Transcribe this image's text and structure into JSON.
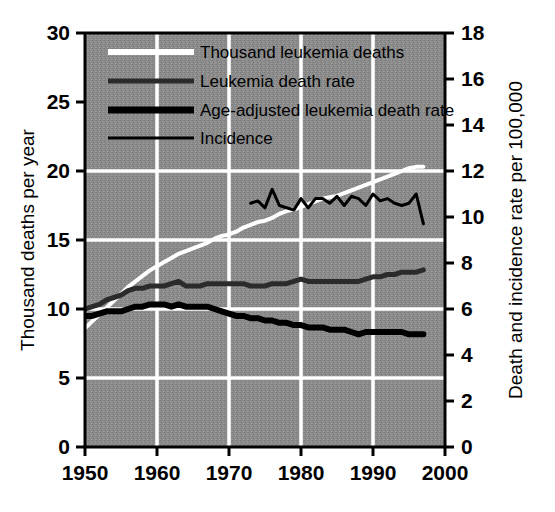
{
  "chart_data": {
    "type": "line",
    "title": "",
    "subtitle": "",
    "xlabel": "",
    "ylabel": "Thousand deaths per year",
    "y2label": "Death and incidence rate per 100,000",
    "xlim": [
      1950,
      2000
    ],
    "ylim": [
      0,
      30
    ],
    "y2lim": [
      0,
      18
    ],
    "xticks": [
      "1950",
      "1960",
      "1970",
      "1980",
      "1990",
      "2000"
    ],
    "xtick_values": [
      1950,
      1960,
      1970,
      1980,
      1990,
      2000
    ],
    "yticks": [
      "0",
      "5",
      "10",
      "15",
      "20",
      "25",
      "30"
    ],
    "ytick_values": [
      0,
      5,
      10,
      15,
      20,
      25,
      30
    ],
    "y2ticks": [
      "0",
      "2",
      "4",
      "6",
      "8",
      "10",
      "12",
      "14",
      "16",
      "18"
    ],
    "y2tick_values": [
      0,
      2,
      4,
      6,
      8,
      10,
      12,
      14,
      16,
      18
    ],
    "grid": "white gridlines on gray plot background, major x at decades, major y at 5/10/15/20 (left scale)",
    "grid_on": true,
    "legend_position": "top-left inside plot",
    "plot_background": "#8a8a8a",
    "gridline_color": "#ffffff",
    "series": [
      {
        "name": "Thousand leukemia deaths",
        "axis": "left",
        "color": "#ffffff",
        "linewidth": 4,
        "x": [
          1950,
          1951,
          1952,
          1953,
          1954,
          1955,
          1956,
          1957,
          1958,
          1959,
          1960,
          1961,
          1962,
          1963,
          1964,
          1965,
          1966,
          1967,
          1968,
          1969,
          1970,
          1971,
          1972,
          1973,
          1974,
          1975,
          1976,
          1977,
          1978,
          1979,
          1980,
          1981,
          1982,
          1983,
          1984,
          1985,
          1986,
          1987,
          1988,
          1989,
          1990,
          1991,
          1992,
          1993,
          1994,
          1995,
          1996,
          1997
        ],
        "values": [
          8.6,
          9.1,
          9.6,
          10.1,
          10.6,
          11.1,
          11.6,
          12.0,
          12.4,
          12.8,
          13.1,
          13.4,
          13.7,
          14.0,
          14.2,
          14.4,
          14.6,
          14.8,
          15.1,
          15.3,
          15.4,
          15.6,
          15.9,
          16.1,
          16.3,
          16.4,
          16.6,
          16.9,
          17.1,
          17.2,
          17.4,
          17.6,
          17.8,
          18.0,
          18.1,
          18.2,
          18.4,
          18.6,
          18.8,
          19.0,
          19.2,
          19.4,
          19.6,
          19.8,
          20.0,
          20.2,
          20.3,
          20.3
        ]
      },
      {
        "name": "Leukemia death rate",
        "axis": "right",
        "color": "#2b2b2b",
        "linewidth": 5,
        "x": [
          1950,
          1951,
          1952,
          1953,
          1954,
          1955,
          1956,
          1957,
          1958,
          1959,
          1960,
          1961,
          1962,
          1963,
          1964,
          1965,
          1966,
          1967,
          1968,
          1969,
          1970,
          1971,
          1972,
          1973,
          1974,
          1975,
          1976,
          1977,
          1978,
          1979,
          1980,
          1981,
          1982,
          1983,
          1984,
          1985,
          1986,
          1987,
          1988,
          1989,
          1990,
          1991,
          1992,
          1993,
          1994,
          1995,
          1996,
          1997
        ],
        "values": [
          6.0,
          6.1,
          6.2,
          6.4,
          6.5,
          6.6,
          6.8,
          6.9,
          6.9,
          7.0,
          7.0,
          7.0,
          7.1,
          7.2,
          7.0,
          7.0,
          7.0,
          7.1,
          7.1,
          7.1,
          7.1,
          7.1,
          7.1,
          7.0,
          7.0,
          7.0,
          7.1,
          7.1,
          7.1,
          7.2,
          7.3,
          7.2,
          7.2,
          7.2,
          7.2,
          7.2,
          7.2,
          7.2,
          7.2,
          7.3,
          7.4,
          7.4,
          7.5,
          7.5,
          7.6,
          7.6,
          7.6,
          7.7
        ]
      },
      {
        "name": "Age-adjusted leukemia death rate",
        "axis": "right",
        "color": "#000000",
        "linewidth": 6,
        "x": [
          1950,
          1951,
          1952,
          1953,
          1954,
          1955,
          1956,
          1957,
          1958,
          1959,
          1960,
          1961,
          1962,
          1963,
          1964,
          1965,
          1966,
          1967,
          1968,
          1969,
          1970,
          1971,
          1972,
          1973,
          1974,
          1975,
          1976,
          1977,
          1978,
          1979,
          1980,
          1981,
          1982,
          1983,
          1984,
          1985,
          1986,
          1987,
          1988,
          1989,
          1990,
          1991,
          1992,
          1993,
          1994,
          1995,
          1996,
          1997
        ],
        "values": [
          5.7,
          5.7,
          5.8,
          5.9,
          5.9,
          5.9,
          6.0,
          6.1,
          6.1,
          6.2,
          6.2,
          6.2,
          6.1,
          6.2,
          6.1,
          6.1,
          6.1,
          6.1,
          6.0,
          5.9,
          5.8,
          5.7,
          5.7,
          5.6,
          5.6,
          5.5,
          5.5,
          5.4,
          5.4,
          5.3,
          5.3,
          5.2,
          5.2,
          5.2,
          5.1,
          5.1,
          5.1,
          5.0,
          4.9,
          5.0,
          5.0,
          5.0,
          5.0,
          5.0,
          5.0,
          4.9,
          4.9,
          4.9
        ]
      },
      {
        "name": "Incidence",
        "axis": "right",
        "color": "#000000",
        "linewidth": 3,
        "x": [
          1973,
          1974,
          1975,
          1976,
          1977,
          1978,
          1979,
          1980,
          1981,
          1982,
          1983,
          1984,
          1985,
          1986,
          1987,
          1988,
          1989,
          1990,
          1991,
          1992,
          1993,
          1994,
          1995,
          1996,
          1997
        ],
        "values": [
          10.6,
          10.7,
          10.4,
          11.2,
          10.5,
          10.4,
          10.3,
          10.8,
          10.4,
          10.8,
          10.8,
          10.6,
          10.9,
          10.5,
          10.9,
          10.8,
          10.5,
          11.0,
          10.7,
          10.8,
          10.6,
          10.5,
          10.6,
          11.0,
          9.7
        ]
      }
    ],
    "annotations": []
  },
  "legend": {
    "items": [
      {
        "label": "Thousand leukemia deaths",
        "swatch": "white-thick-line"
      },
      {
        "label": "Leukemia death rate",
        "swatch": "dark-gray-line"
      },
      {
        "label": "Age-adjusted leukemia death rate",
        "swatch": "black-thick-line"
      },
      {
        "label": "Incidence",
        "swatch": "black-thin-line"
      }
    ]
  },
  "axes": {
    "left_title": "Thousand deaths per year",
    "right_title": "Death and incidence rate per 100,000"
  }
}
